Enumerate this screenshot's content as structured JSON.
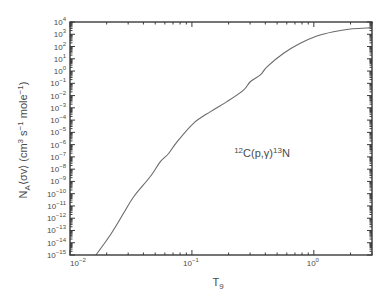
{
  "chart_data": {
    "type": "line",
    "title": "",
    "xlabel": "T₉",
    "xlabel_parts": [
      {
        "t": "T"
      },
      {
        "t": "9",
        "sub": true
      }
    ],
    "ylabel": "N_A⟨σv⟩ (cm³ s⁻¹ mole⁻¹)",
    "ylabel_parts": [
      {
        "t": "N"
      },
      {
        "t": "A",
        "sub": true
      },
      {
        "t": "⟨σv⟩   (cm"
      },
      {
        "t": "3",
        "sup": true
      },
      {
        "t": " s"
      },
      {
        "t": "−1",
        "sup": true
      },
      {
        "t": "  mole"
      },
      {
        "t": "−1",
        "sup": true
      },
      {
        "t": ")"
      }
    ],
    "xscale": "log",
    "yscale": "log",
    "xlim": [
      0.01,
      3
    ],
    "ylim": [
      1e-15,
      10000.0
    ],
    "grid": false,
    "legend": null,
    "x_ticks": [
      {
        "value": 0.01,
        "base": "10",
        "exp": "−2"
      },
      {
        "value": 0.1,
        "base": "10",
        "exp": "−1"
      },
      {
        "value": 1,
        "base": "10",
        "exp": "0"
      }
    ],
    "y_ticks": [
      {
        "value": 10000.0,
        "base": "10",
        "exp": "4"
      },
      {
        "value": 1000.0,
        "base": "10",
        "exp": "3"
      },
      {
        "value": 100.0,
        "base": "10",
        "exp": "2"
      },
      {
        "value": 10.0,
        "base": "10",
        "exp": "1"
      },
      {
        "value": 1.0,
        "base": "10",
        "exp": "0"
      },
      {
        "value": 0.1,
        "base": "10",
        "exp": "−1"
      },
      {
        "value": 0.01,
        "base": "10",
        "exp": "−2"
      },
      {
        "value": 0.001,
        "base": "10",
        "exp": "−3"
      },
      {
        "value": 0.0001,
        "base": "10",
        "exp": "−4"
      },
      {
        "value": 1e-05,
        "base": "10",
        "exp": "−5"
      },
      {
        "value": 1e-06,
        "base": "10",
        "exp": "−6"
      },
      {
        "value": 1e-07,
        "base": "10",
        "exp": "−7"
      },
      {
        "value": 1e-08,
        "base": "10",
        "exp": "−8"
      },
      {
        "value": 1e-09,
        "base": "10",
        "exp": "−9"
      },
      {
        "value": 1e-10,
        "base": "10",
        "exp": "−10"
      },
      {
        "value": 1e-11,
        "base": "10",
        "exp": "−11"
      },
      {
        "value": 1e-12,
        "base": "10",
        "exp": "−12"
      },
      {
        "value": 1e-13,
        "base": "10",
        "exp": "−13"
      },
      {
        "value": 1e-14,
        "base": "10",
        "exp": "−14"
      },
      {
        "value": 1e-15,
        "base": "10",
        "exp": "−15"
      }
    ],
    "annotations": [
      {
        "text": "12C(p,γ)13N",
        "parts": [
          {
            "t": "12",
            "sup": true
          },
          {
            "t": "C(p,γ)"
          },
          {
            "t": "13",
            "sup": true
          },
          {
            "t": "N"
          }
        ],
        "x": 0.6,
        "y": 3e-07
      }
    ],
    "series": [
      {
        "name": "12C(p,γ)13N",
        "color": "#6a6a6a",
        "x": [
          0.0161,
          0.0214,
          0.0275,
          0.0333,
          0.0456,
          0.0551,
          0.0644,
          0.0755,
          0.103,
          0.142,
          0.194,
          0.265,
          0.301,
          0.364,
          0.413,
          0.565,
          0.774,
          1.06,
          1.45,
          1.99,
          2.72,
          3.0
        ],
        "y": [
          8.3e-16,
          4.3e-14,
          2.5e-12,
          5.6e-11,
          2.5e-09,
          4.1e-08,
          1.9e-07,
          1.7e-06,
          5.5e-05,
          0.00049,
          0.0032,
          0.028,
          0.135,
          0.48,
          2.2,
          28,
          182,
          724,
          1620,
          2690,
          3240,
          3550
        ]
      }
    ],
    "colors": {
      "frame": "#3a3a3a",
      "text": "#4a4a4a",
      "curve": "#6a6a6a"
    }
  }
}
